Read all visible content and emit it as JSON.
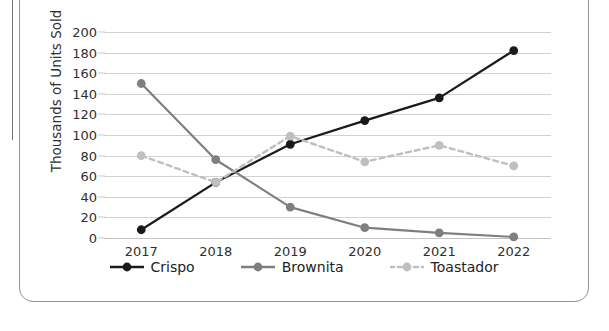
{
  "chart_data": {
    "type": "line",
    "title": "",
    "xlabel": "",
    "ylabel": "Thousands of Units Sold",
    "categories": [
      "2017",
      "2018",
      "2019",
      "2020",
      "2021",
      "2022"
    ],
    "x_tick_labels": [
      "2017",
      "2018",
      "2019",
      "2020",
      "2021",
      "2022"
    ],
    "y_tick_labels": [
      "200",
      "180",
      "160",
      "140",
      "120",
      "100",
      "80",
      "60",
      "40",
      "20",
      "0"
    ],
    "y_ticks": [
      200,
      180,
      160,
      140,
      120,
      100,
      80,
      60,
      40,
      20,
      0
    ],
    "ylim": [
      0,
      200
    ],
    "grid": true,
    "legend_position": "bottom",
    "series": [
      {
        "name": "Crispo",
        "values": [
          8,
          54,
          91,
          114,
          136,
          182
        ],
        "color": "#1a1a1a",
        "style": "solid",
        "marker": "circle"
      },
      {
        "name": "Brownita",
        "values": [
          150,
          76,
          30,
          10,
          5,
          1
        ],
        "color": "#7f7f7f",
        "style": "solid",
        "marker": "circle"
      },
      {
        "name": "Toastador",
        "values": [
          80,
          54,
          99,
          74,
          90,
          70
        ],
        "color": "#bfbfbf",
        "style": "dashed",
        "marker": "circle"
      }
    ]
  },
  "legend": {
    "items": [
      {
        "label": "Crispo",
        "color": "#1a1a1a",
        "style": "solid"
      },
      {
        "label": "Brownita",
        "color": "#7f7f7f",
        "style": "solid"
      },
      {
        "label": "Toastador",
        "color": "#bfbfbf",
        "style": "dashed"
      }
    ]
  }
}
